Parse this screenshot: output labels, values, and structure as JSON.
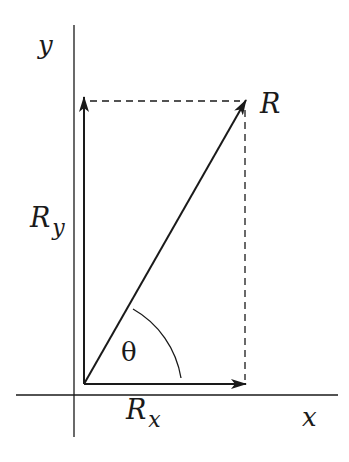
{
  "diagram": {
    "type": "vector-components",
    "colors": {
      "ink": "#1a1a1a",
      "background": "#ffffff"
    },
    "axes": {
      "x_label": "x",
      "y_label": "y",
      "origin": [
        74,
        395
      ],
      "x_axis": {
        "from": [
          16,
          395
        ],
        "to": [
          338,
          395
        ]
      },
      "y_axis": {
        "from": [
          74,
          25
        ],
        "to": [
          74,
          437
        ]
      }
    },
    "vectors": [
      {
        "name": "R",
        "label": "R",
        "from": [
          84,
          384
        ],
        "to": [
          245,
          101
        ]
      },
      {
        "name": "Rx",
        "label": "R",
        "subscript": "x",
        "from": [
          84,
          384
        ],
        "to": [
          245,
          384
        ]
      },
      {
        "name": "Ry",
        "label": "R",
        "subscript": "y",
        "from": [
          84,
          384
        ],
        "to": [
          84,
          98
        ]
      }
    ],
    "dashed_lines": [
      {
        "from": [
          90,
          101
        ],
        "to": [
          240,
          101
        ]
      },
      {
        "from": [
          245,
          108
        ],
        "to": [
          245,
          380
        ]
      }
    ],
    "angle": {
      "label": "θ",
      "vertex": [
        84,
        384
      ],
      "radius": 97,
      "between": [
        "Rx",
        "R"
      ]
    }
  }
}
